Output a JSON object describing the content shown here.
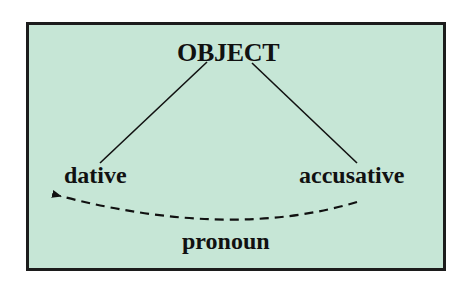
{
  "diagram": {
    "root": {
      "label": "OBJECT"
    },
    "children": [
      {
        "label": "dative"
      },
      {
        "label": "accusative"
      }
    ],
    "movement": {
      "label": "pronoun",
      "from": "accusative",
      "to": "dative",
      "style": "dashed-arrow"
    },
    "colors": {
      "background": "#c6e6d6",
      "border": "#1c1c1c",
      "text": "#111111"
    }
  }
}
